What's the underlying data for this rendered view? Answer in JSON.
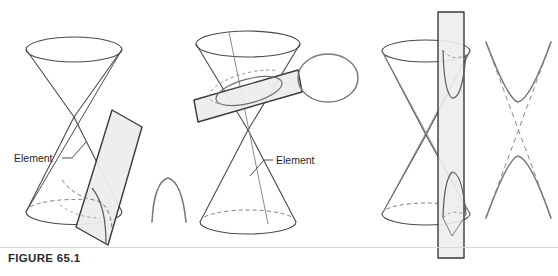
{
  "figure": {
    "caption": "FIGURE 65.1",
    "width": 558,
    "height": 276,
    "background_color": "#ffffff",
    "line_color": "#4a4a4a",
    "dashed_line_color": "#6f6f6f",
    "plane_fill_color": "#ededed",
    "plane_edge_color": "#3a3a3a",
    "curve_color": "#707070",
    "label_color": "#1f1f1f"
  },
  "panels": [
    {
      "id": "panel-parabola",
      "name": "double-cone-parabola",
      "label": "Element",
      "section_type": "parabola",
      "description": "Double cone cut by a plane parallel to an element, producing a parabola",
      "label_x": 14,
      "label_y": 162,
      "leader": {
        "x1": 63,
        "y1": 158,
        "x2": 84,
        "y2": 144
      }
    },
    {
      "id": "panel-ellipse",
      "name": "double-cone-ellipse",
      "label": "Element",
      "section_type": "ellipse",
      "description": "Double cone cut by a plane oblique to the axis cutting one nappe, producing an ellipse",
      "label_x": 276,
      "label_y": 164,
      "leader": {
        "x1": 272,
        "y1": 160,
        "x2": 251,
        "y2": 174
      }
    },
    {
      "id": "panel-hyperbola",
      "name": "double-cone-hyperbola",
      "label": "",
      "section_type": "hyperbola",
      "description": "Double cone cut by a plane parallel to the axis cutting both nappes, producing a hyperbola with asymptotes",
      "label_x": 0,
      "label_y": 0,
      "leader": null
    }
  ],
  "resulting_curves": [
    {
      "name": "parabola-curve",
      "type": "parabola",
      "panel": "panel-parabola"
    },
    {
      "name": "ellipse-curve",
      "type": "ellipse",
      "panel": "panel-ellipse"
    },
    {
      "name": "hyperbola-curve",
      "type": "hyperbola",
      "panel": "panel-hyperbola"
    }
  ]
}
